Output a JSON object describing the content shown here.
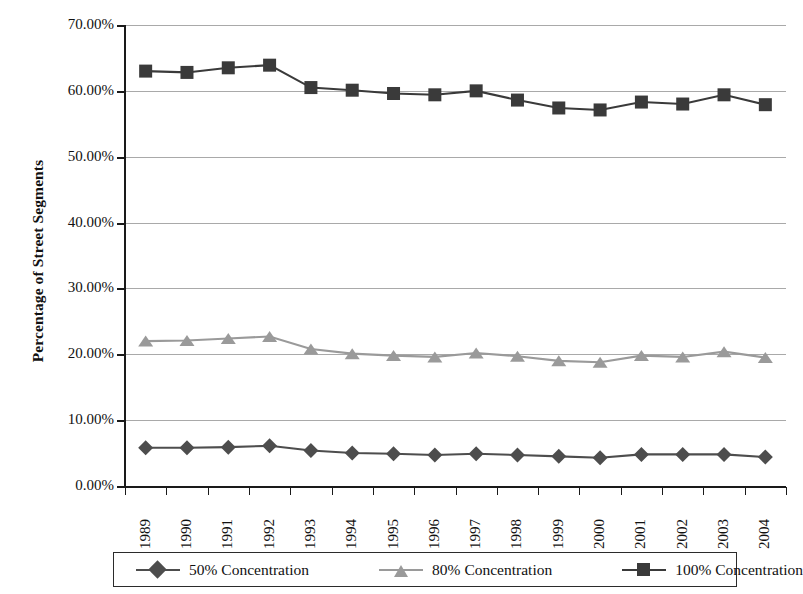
{
  "chart_data": {
    "type": "line",
    "title": "",
    "xlabel": "",
    "ylabel": "Percentage of Street Segments",
    "ylim": [
      0,
      70
    ],
    "ytick_values": [
      0,
      10,
      20,
      30,
      40,
      50,
      60,
      70
    ],
    "ytick_labels": [
      "0.00%",
      "10.00%",
      "20.00%",
      "30.00%",
      "40.00%",
      "50.00%",
      "60.00%",
      "70.00%"
    ],
    "grid": true,
    "legend_position": "bottom",
    "categories": [
      "1989",
      "1990",
      "1991",
      "1992",
      "1993",
      "1994",
      "1995",
      "1996",
      "1997",
      "1998",
      "1999",
      "2000",
      "2001",
      "2002",
      "2003",
      "2004"
    ],
    "series": [
      {
        "name": "50% Concentration",
        "marker": "diamond",
        "color": "#4d4d4d",
        "values": [
          5.8,
          5.8,
          5.9,
          6.1,
          5.4,
          5.0,
          4.9,
          4.7,
          4.9,
          4.7,
          4.5,
          4.3,
          4.8,
          4.8,
          4.8,
          4.4
        ]
      },
      {
        "name": "80% Concentration",
        "marker": "triangle",
        "color": "#9a9a9a",
        "values": [
          22.0,
          22.1,
          22.4,
          22.7,
          20.8,
          20.1,
          19.8,
          19.6,
          20.2,
          19.7,
          19.0,
          18.8,
          19.8,
          19.6,
          20.4,
          19.5
        ]
      },
      {
        "name": "100% Concentration",
        "marker": "square",
        "color": "#3a3a3a",
        "values": [
          63.0,
          62.8,
          63.5,
          63.9,
          60.5,
          60.1,
          59.6,
          59.4,
          60.0,
          58.6,
          57.4,
          57.1,
          58.3,
          58.0,
          59.4,
          57.9
        ]
      }
    ]
  },
  "legend": {
    "items": [
      {
        "label": "50% Concentration",
        "marker": "diamond-marker",
        "color": "#4d4d4d"
      },
      {
        "label": "80% Concentration",
        "marker": "triangle-marker",
        "color": "#9a9a9a"
      },
      {
        "label": "100% Concentration",
        "marker": "square-marker",
        "color": "#3a3a3a"
      }
    ]
  },
  "axes": {
    "y_title": "Percentage of Street Segments"
  }
}
